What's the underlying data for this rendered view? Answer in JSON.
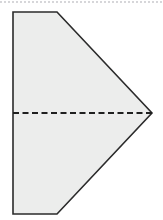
{
  "figure": {
    "canvas": {
      "width": 163,
      "height": 220,
      "background": "#ffffff"
    },
    "shape": {
      "name": "home-plate-pentagon",
      "description": "Pentagon shaped like a sideways house / home plate pointing right",
      "fill": "#ecedec",
      "stroke": "#2b2b2b",
      "stroke_width": 1.6,
      "points": "13,12 57,12 152,113 57,214 13,214",
      "vertices": [
        {
          "label": "top-left",
          "x": 13,
          "y": 12
        },
        {
          "label": "top-right",
          "x": 57,
          "y": 12
        },
        {
          "label": "right-apex",
          "x": 152,
          "y": 113
        },
        {
          "label": "bottom-right",
          "x": 57,
          "y": 214
        },
        {
          "label": "bottom-left",
          "x": 13,
          "y": 214
        }
      ]
    },
    "crease": {
      "name": "horizontal-fold-line",
      "style": "dashed",
      "stroke": "#1f1f1f",
      "stroke_width": 2.2,
      "dash_pattern": "6,3.5",
      "x1": 13,
      "y1": 113,
      "x2": 152,
      "y2": 113
    },
    "scan_artifact": {
      "name": "top-scan-dotted-edge",
      "visible": true,
      "color": "#78788280"
    }
  }
}
